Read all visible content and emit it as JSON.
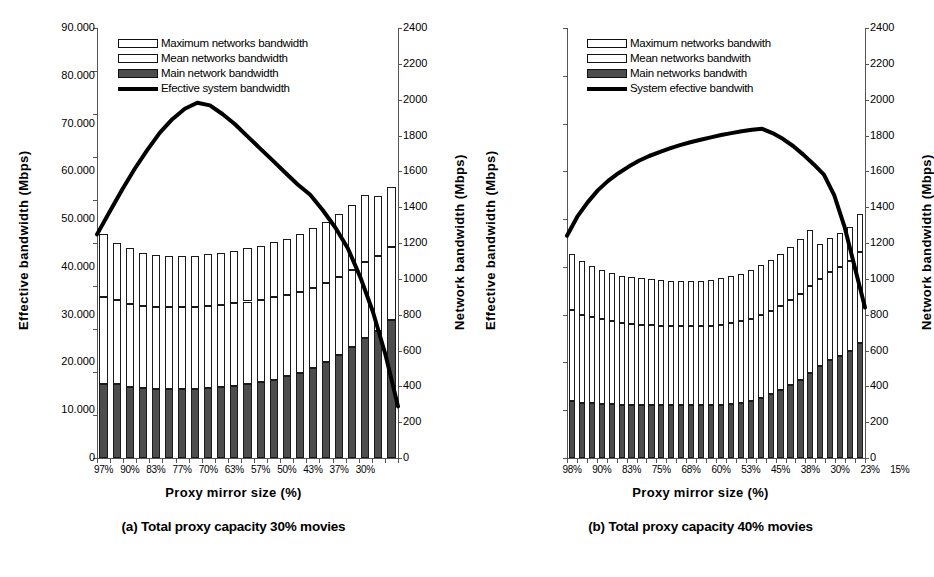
{
  "figure": {
    "panels": [
      {
        "id": "panel-a",
        "caption": "(a) Total proxy capacity 30% movies",
        "xlabel": "Proxy mirror size (%)",
        "ylabel_primary": "Effective bandwidth (Mbps)",
        "ylabel_secondary": "Network bandwidth (Mbps)",
        "legend": [
          "Maximum networks bandwidth",
          "Mean networks bandwidth",
          "Main network bandwidth",
          "Efective system bandwidth"
        ]
      },
      {
        "id": "panel-b",
        "caption": "(b) Total proxy capacity 40% movies",
        "xlabel": "Proxy mirror size (%)",
        "ylabel_primary": "Effective bandwidth (Mbps)",
        "ylabel_secondary": "Network bandwidth (Mbps)",
        "legend": [
          "Maximum networks bandwith",
          "Mean networks bandwith",
          "Main networks bandwith",
          "System efective bandwith"
        ]
      }
    ]
  },
  "chart_data": [
    {
      "type": "bar",
      "id": "panel-a",
      "title": "(a) Total proxy capacity 30% movies",
      "xlabel": "Proxy mirror size (%)",
      "ylabel": "Effective bandwidth (Mbps)",
      "ylabel_secondary": "Network bandwidth (Mbps)",
      "ylim": [
        0,
        50
      ],
      "yticks": [
        "0",
        "5.000",
        "10.000",
        "15.000",
        "20.000",
        "25.000",
        "30.000",
        "35.000",
        "40.000",
        "45.000",
        "50.000"
      ],
      "ylim_secondary": [
        0,
        2400
      ],
      "yticks_secondary": [
        "0",
        "200",
        "400",
        "600",
        "800",
        "1000",
        "1200",
        "1400",
        "1600",
        "1800",
        "2000",
        "2200",
        "2400"
      ],
      "grid": false,
      "legend_position": "top-center",
      "stacked": true,
      "xticklabels": [
        "97%",
        "90%",
        "83%",
        "77%",
        "70%",
        "63%",
        "57%",
        "50%",
        "43%",
        "37%",
        "30%"
      ],
      "xticklabel_every": 2,
      "n_bars": 23,
      "series": [
        {
          "name": "Main network bandwidth",
          "values": [
            8.6,
            8.6,
            8.3,
            8.1,
            8.0,
            8.0,
            8.0,
            8.0,
            8.1,
            8.2,
            8.4,
            8.6,
            8.8,
            9.1,
            9.5,
            9.9,
            10.5,
            11.2,
            12.0,
            12.9,
            13.9,
            14.8,
            16.0
          ]
        },
        {
          "name": "Mean networks bandwidth",
          "values": [
            10.1,
            9.8,
            9.6,
            9.6,
            9.6,
            9.6,
            9.6,
            9.6,
            9.6,
            9.6,
            9.6,
            9.6,
            9.6,
            9.6,
            9.5,
            9.4,
            9.3,
            9.2,
            9.1,
            9.0,
            8.9,
            8.7,
            8.5
          ]
        },
        {
          "name": "Maximum networks bandwidth",
          "values": [
            7.3,
            6.6,
            6.5,
            6.1,
            6.0,
            5.9,
            5.9,
            5.9,
            6.0,
            6.0,
            6.1,
            6.2,
            6.3,
            6.4,
            6.5,
            6.7,
            6.9,
            7.1,
            7.3,
            7.5,
            7.8,
            7.0,
            7.0
          ]
        }
      ],
      "line": {
        "name": "Efective system bandwidth",
        "axis": "secondary",
        "values_primary": [
          26.0,
          28.6,
          31.2,
          33.6,
          35.8,
          37.8,
          39.4,
          40.6,
          41.3,
          41.0,
          40.0,
          38.8,
          37.4,
          36.0,
          34.6,
          33.2,
          31.8,
          30.6,
          28.8,
          26.8,
          24.4,
          21.0,
          17.0,
          12.0,
          6.0
        ]
      }
    },
    {
      "type": "bar",
      "id": "panel-b",
      "title": "(b) Total proxy capacity 40% movies",
      "xlabel": "Proxy mirror size (%)",
      "ylabel": "Effective bandwidth (Mbps)",
      "ylabel_secondary": "Network bandwidth (Mbps)",
      "ylim": [
        0,
        90
      ],
      "yticks": [
        "0",
        "10.000",
        "20.000",
        "30.000",
        "40.000",
        "50.000",
        "60.000",
        "70.000",
        "80.000",
        "90.000"
      ],
      "ylim_secondary": [
        0,
        2400
      ],
      "yticks_secondary": [
        "0",
        "200",
        "400",
        "600",
        "800",
        "1000",
        "1200",
        "1400",
        "1600",
        "1800",
        "2000",
        "2200",
        "2400"
      ],
      "grid": false,
      "legend_position": "top-center",
      "stacked": true,
      "xticklabels": [
        "98%",
        "90%",
        "83%",
        "75%",
        "68%",
        "60%",
        "53%",
        "45%",
        "38%",
        "30%",
        "23%",
        "15%"
      ],
      "xticklabel_every": 3,
      "n_bars": 30,
      "series": [
        {
          "name": "Main networks bandwidth",
          "values": [
            11.9,
            11.6,
            11.5,
            11.4,
            11.3,
            11.2,
            11.1,
            11.0,
            11.0,
            11.0,
            11.0,
            11.0,
            11.0,
            11.0,
            11.0,
            11.1,
            11.3,
            11.6,
            12.0,
            12.6,
            13.3,
            14.2,
            15.2,
            16.4,
            17.7,
            19.2,
            20.5,
            21.4,
            22.4,
            24.0
          ]
        },
        {
          "name": "Mean networks bandwidth",
          "values": [
            19.1,
            18.4,
            18.0,
            17.6,
            17.3,
            17.1,
            17.0,
            16.9,
            16.8,
            16.7,
            16.7,
            16.6,
            16.6,
            16.6,
            16.7,
            16.8,
            16.9,
            17.0,
            17.2,
            17.3,
            17.5,
            17.6,
            17.8,
            18.0,
            18.2,
            18.3,
            18.4,
            18.6,
            18.9,
            19.2
          ]
        },
        {
          "name": "Maximum networks bandwith",
          "values": [
            11.8,
            11.2,
            10.7,
            10.3,
            10.1,
            9.9,
            9.8,
            9.7,
            9.6,
            9.5,
            9.4,
            9.4,
            9.4,
            9.5,
            9.6,
            9.7,
            9.8,
            10.0,
            10.2,
            10.4,
            10.6,
            10.9,
            11.2,
            11.5,
            11.8,
            7.3,
            7.2,
            7.1,
            7.0,
            7.8
          ]
        }
      ],
      "line": {
        "name": "System efective bandwidth",
        "axis": "secondary",
        "values_primary": [
          46.5,
          50.5,
          53.5,
          56.0,
          58.0,
          59.6,
          61.0,
          62.2,
          63.2,
          64.0,
          64.8,
          65.5,
          66.1,
          66.6,
          67.1,
          67.6,
          68.0,
          68.4,
          68.7,
          68.9,
          68.0,
          66.8,
          65.3,
          63.5,
          61.5,
          59.3,
          55.0,
          48.5,
          40.0,
          31.5
        ]
      }
    }
  ]
}
